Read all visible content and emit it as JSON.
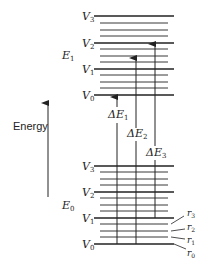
{
  "diagram": {
    "axis_label": "Energy",
    "upper_state": {
      "label": "E",
      "subscript": "1",
      "levels": [
        {
          "label": "V",
          "subscript": "0",
          "y": 95
        },
        {
          "label": "V",
          "subscript": "1",
          "y": 69
        },
        {
          "label": "V",
          "subscript": "2",
          "y": 43
        },
        {
          "label": "V",
          "subscript": "3",
          "y": 16
        }
      ]
    },
    "lower_state": {
      "label": "E",
      "subscript": "0",
      "levels": [
        {
          "label": "V",
          "subscript": "0",
          "y": 244
        },
        {
          "label": "V",
          "subscript": "1",
          "y": 218
        },
        {
          "label": "V",
          "subscript": "2",
          "y": 192
        },
        {
          "label": "V",
          "subscript": "3",
          "y": 166
        }
      ]
    },
    "rotational_labels": [
      {
        "label": "r",
        "subscript": "3"
      },
      {
        "label": "r",
        "subscript": "2"
      },
      {
        "label": "r",
        "subscript": "1"
      },
      {
        "label": "r",
        "subscript": "0"
      }
    ],
    "transitions": [
      {
        "label": "ΔE",
        "subscript": "1",
        "x": 117,
        "y_from": 244,
        "y_to": 96
      },
      {
        "label": "ΔE",
        "subscript": "2",
        "x": 136,
        "y_from": 244,
        "y_to": 57
      },
      {
        "label": "ΔE",
        "subscript": "3",
        "x": 155,
        "y_from": 218,
        "y_to": 43
      }
    ],
    "colors": {
      "line": "#222222",
      "thin_line": "#444444",
      "background": "#ffffff"
    }
  }
}
